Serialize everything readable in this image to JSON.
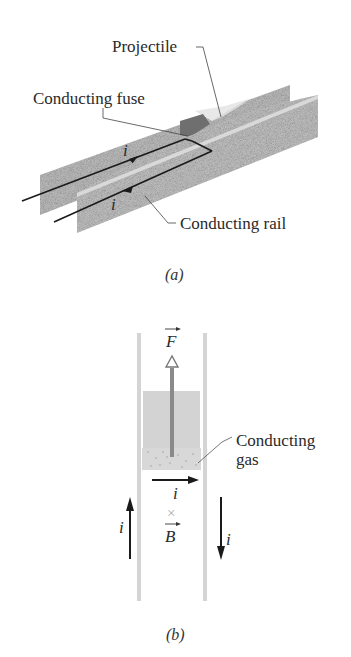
{
  "figure_a": {
    "caption": "(a)",
    "labels": {
      "projectile": "Projectile",
      "fuse": "Conducting fuse",
      "rail": "Conducting rail",
      "current_top": "i",
      "current_bottom": "i"
    }
  },
  "figure_b": {
    "caption": "(b)",
    "labels": {
      "force": "F",
      "gas_line1": "Conducting",
      "gas_line2": "gas",
      "current_middle": "i",
      "current_left": "i",
      "current_right": "i",
      "field_symbol": "×",
      "field": "B"
    }
  },
  "colors": {
    "rail": "#c9c9c9",
    "rail_dark": "#a9a9a9",
    "projectile": "#e6e6e6",
    "fuse": "#6e6e6e",
    "arrow": "#1a1a1a",
    "force_arrow": "#8a8a8a"
  }
}
